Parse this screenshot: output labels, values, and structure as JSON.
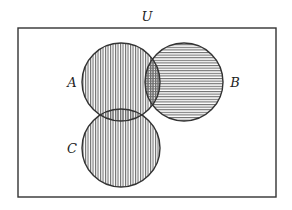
{
  "diagram": {
    "type": "venn",
    "universe": {
      "label": "U",
      "rect": {
        "x": 18,
        "y": 28,
        "w": 258,
        "h": 169
      },
      "label_pos": {
        "x": 147,
        "y": 21
      }
    },
    "sets": [
      {
        "id": "A",
        "label": "A",
        "cx": 121,
        "cy": 82,
        "r": 39,
        "hatch": "vertical",
        "label_pos": {
          "x": 72,
          "y": 87
        }
      },
      {
        "id": "B",
        "label": "B",
        "cx": 184,
        "cy": 82,
        "r": 39,
        "hatch": "horizontal",
        "label_pos": {
          "x": 235,
          "y": 87
        }
      },
      {
        "id": "C",
        "label": "C",
        "cx": 121,
        "cy": 148,
        "r": 39,
        "hatch": "vertical",
        "label_pos": {
          "x": 72,
          "y": 153
        }
      }
    ],
    "shaded_description": "A and C shaded with vertical lines; B shaded with horizontal lines; A∩B cross-hatched",
    "colors": {
      "stroke": "#333333",
      "hatch": "#6e6e6e",
      "background": "#ffffff"
    }
  }
}
